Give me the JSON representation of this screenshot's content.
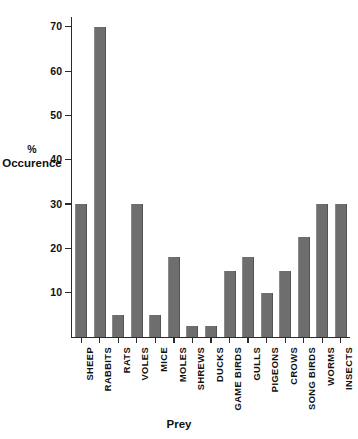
{
  "chart_data": {
    "type": "bar",
    "title": "",
    "xlabel": "Prey",
    "ylabel_line1": "%",
    "ylabel_line2": "Occurence",
    "ylabel": "% Occurence",
    "ylim": [
      0,
      72
    ],
    "ytick_values": [
      10,
      20,
      30,
      40,
      50,
      60,
      70
    ],
    "ytick_labels": [
      "10",
      "20",
      "30",
      "40",
      "50",
      "60",
      "70"
    ],
    "grid": false,
    "legend": false,
    "bar_color": "#6e6e6e",
    "axis_color": "#2b2b2b",
    "background_color": "#ffffff",
    "categories": [
      "SHEEP",
      "RABBITS",
      "RATS",
      "VOLES",
      "MICE",
      "MOLES",
      "SHREWS",
      "DUCKS",
      "GAME BIRDS",
      "GULLS",
      "PIGEONS",
      "CROWS",
      "SONG BIRDS",
      "WORMS",
      "INSECTS"
    ],
    "values": [
      30,
      70,
      5,
      30,
      5,
      18,
      2.5,
      2.5,
      15,
      18,
      10,
      15,
      22.5,
      30,
      30
    ]
  }
}
